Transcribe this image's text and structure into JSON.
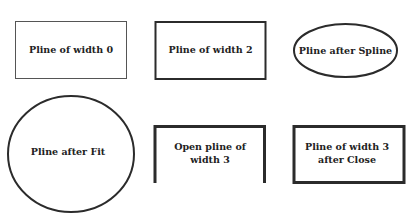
{
  "diagram": {
    "stroke_color": "#2b2b2b",
    "shapes": [
      {
        "id": "pline-width-0",
        "type": "rect",
        "label_lines": [
          "Pline of width 0"
        ],
        "stroke_width": 1
      },
      {
        "id": "pline-width-2",
        "type": "rect",
        "label_lines": [
          "Pline of width 2"
        ],
        "stroke_width": 2
      },
      {
        "id": "pline-after-spline",
        "type": "ellipse",
        "label_lines": [
          "Pline after Spline"
        ],
        "stroke_width": 2
      },
      {
        "id": "pline-after-fit",
        "type": "circle",
        "label_lines": [
          "Pline after Fit"
        ],
        "stroke_width": 2
      },
      {
        "id": "open-pline-width-3",
        "type": "open-rect",
        "label_lines": [
          "Open pline of",
          "width 3"
        ],
        "stroke_width": 3
      },
      {
        "id": "pline-width-3-after-close",
        "type": "rect",
        "label_lines": [
          "Pline of width 3",
          "after Close"
        ],
        "stroke_width": 3
      }
    ]
  }
}
